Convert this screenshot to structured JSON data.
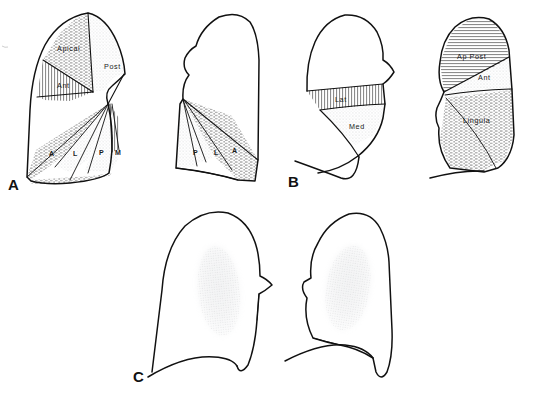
{
  "figure": {
    "background_color": "#ffffff",
    "ink_color": "#111111",
    "shade_color": "#b9bcc0",
    "panels": [
      {
        "letter": "A",
        "name": "panel-a",
        "description": "Upper lobe segments, lateral projections",
        "lungs": [
          {
            "side": "left-view",
            "labels": [
              {
                "text": "Apical",
                "pattern": "horizontal-dash"
              },
              {
                "text": "Post",
                "pattern": "light-stipple"
              },
              {
                "text": "Ant",
                "pattern": "vertical-hatch"
              },
              {
                "text": "A",
                "pattern": "horizontal-dash"
              },
              {
                "text": "L",
                "pattern": "light-stipple"
              },
              {
                "text": "P",
                "pattern": "light-stipple"
              },
              {
                "text": "M",
                "pattern": "vertical-hatch"
              }
            ]
          },
          {
            "side": "right-view",
            "labels": [
              {
                "text": "P",
                "pattern": "light-stipple"
              },
              {
                "text": "L",
                "pattern": "light-stipple"
              },
              {
                "text": "A",
                "pattern": "horizontal-dash"
              }
            ]
          }
        ]
      },
      {
        "letter": "B",
        "name": "panel-b",
        "description": "Middle lobe and lingula segments",
        "lungs": [
          {
            "side": "left-view",
            "labels": [
              {
                "text": "Lat",
                "pattern": "vertical-hatch"
              },
              {
                "text": "Med",
                "pattern": "light-stipple"
              }
            ]
          },
          {
            "side": "right-view",
            "labels": [
              {
                "text": "Ap Post",
                "pattern": "horizontal-line"
              },
              {
                "text": "Ant",
                "pattern": "light-stipple"
              },
              {
                "text": "Lingula",
                "pattern": "horizontal-dash"
              }
            ]
          }
        ]
      },
      {
        "letter": "C",
        "name": "panel-c",
        "description": "Lung outlines with central shaded opacity",
        "lungs": [
          {
            "side": "left-view",
            "labels": []
          },
          {
            "side": "right-view",
            "labels": []
          }
        ]
      }
    ]
  }
}
